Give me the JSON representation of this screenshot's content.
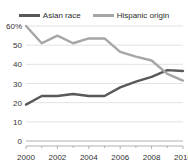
{
  "chart_data": {
    "type": "line",
    "title": "",
    "subtitle": "",
    "xlabel": "",
    "ylabel": "",
    "x": [
      2000,
      2001,
      2002,
      2003,
      2004,
      2005,
      2006,
      2007,
      2008,
      2009,
      2010
    ],
    "xlim": [
      2000,
      2010
    ],
    "ylim": [
      0,
      60
    ],
    "xticks": [
      2000,
      2002,
      2004,
      2006,
      2008,
      2010
    ],
    "xtick_labels": [
      "2000",
      "2002",
      "2004",
      "2006",
      "2008",
      "2010"
    ],
    "xminor_ticks": [
      2001,
      2003,
      2005,
      2007,
      2009
    ],
    "yticks": [
      0,
      10,
      20,
      30,
      40,
      50,
      60
    ],
    "ytick_labels": [
      "0",
      "10",
      "20",
      "30",
      "40",
      "50",
      "60%"
    ],
    "grid": "horizontal",
    "legend_position": "top-center",
    "series": [
      {
        "name": "Asian race",
        "color": "#595959",
        "values": [
          19,
          23.5,
          23.5,
          24.5,
          23.5,
          23.5,
          28,
          31,
          33.5,
          37,
          36.5
        ]
      },
      {
        "name": "Hispanic origin",
        "color": "#a6a6a6",
        "values": [
          60,
          51,
          55,
          51,
          53.5,
          53.5,
          46.5,
          44,
          42,
          35,
          31.5
        ]
      }
    ]
  },
  "legend": {
    "items": [
      {
        "label": "Asian race",
        "color": "#595959"
      },
      {
        "label": "Hispanic origin",
        "color": "#a6a6a6"
      }
    ]
  },
  "axis": {
    "line_color": "#b0b0b0",
    "grid_color": "#e2e2e2"
  }
}
